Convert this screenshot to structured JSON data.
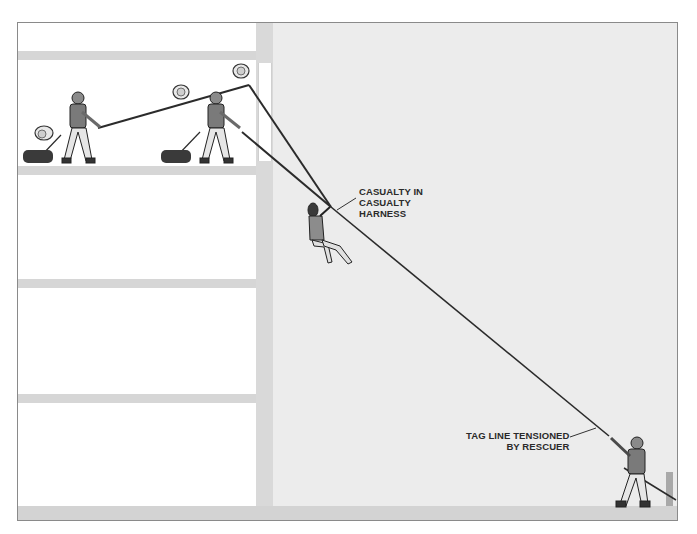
{
  "diagram": {
    "type": "technical-illustration",
    "labels": {
      "casualty": [
        "CASUALTY IN",
        "CASUALTY",
        "HARNESS"
      ],
      "tag_line": [
        "TAG LINE TENSIONED",
        "BY RESCUER"
      ]
    },
    "elements": {
      "building_floors": 4,
      "upper_rescuers": 2,
      "ground_rescuers": 1,
      "casualty": 1,
      "pulleys": 4,
      "anchors": 2
    },
    "colors": {
      "frame_border": "#8a8a8a",
      "building_interior": "#ffffff",
      "structure_gray": "#d6d6d6",
      "outdoor_bg": "#ececec",
      "rope": "#2b2b2b",
      "rescuer_body": "#7a7a7a",
      "rescuer_legs": "#e6e6e6",
      "casualty_body": "#8c8c8c"
    }
  }
}
